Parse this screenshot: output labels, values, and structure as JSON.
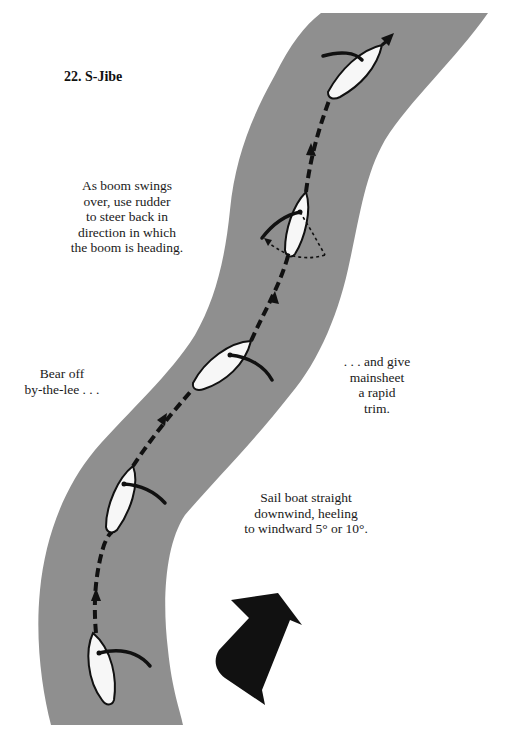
{
  "title": "22. S-Jibe",
  "colors": {
    "water": "#8f8f8f",
    "hull": "#f7f7f7",
    "ink": "#111111",
    "background": "#ffffff"
  },
  "annotations": {
    "boom_swing": "As boom swings\nover, use rudder\nto steer back in\ndirection in which\nthe boom is heading.",
    "bear_off": "Bear off\nby-the-lee . . .",
    "give_mainsheet": ". . . and give\nmainsheet\na rapid\ntrim.",
    "sail_straight": "Sail boat straight\ndownwind, heeling\nto windward 5° or 10°."
  },
  "diagram": {
    "boats": [
      {
        "id": "boat-1-start",
        "position": "bottom",
        "heading": "straight downwind"
      },
      {
        "id": "boat-2",
        "position": "lower-middle",
        "heading": "bearing off"
      },
      {
        "id": "boat-3",
        "position": "middle",
        "heading": "by-the-lee"
      },
      {
        "id": "boat-4-jibe",
        "position": "upper-middle",
        "heading": "boom swinging over"
      },
      {
        "id": "boat-5-finish",
        "position": "top",
        "heading": "new course"
      }
    ],
    "path": "dashed course line with direction arrows",
    "wind_arrow": "large black wind direction arrow pointing up-right"
  }
}
